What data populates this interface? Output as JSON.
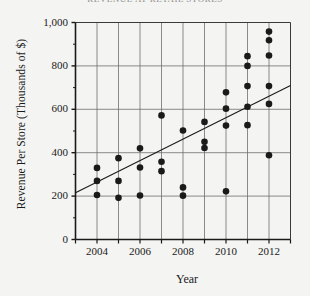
{
  "chart_data": {
    "type": "scatter",
    "title": "REVENUE AT RETAIL STORES",
    "xlabel": "Year",
    "ylabel": "Revenue Per Store (Thousands of $)",
    "xlim": [
      2003,
      2013
    ],
    "ylim": [
      0,
      1000
    ],
    "yticks": [
      "0",
      "200",
      "400",
      "600",
      "800",
      "1,000"
    ],
    "ytick_values": [
      0,
      200,
      400,
      600,
      800,
      1000
    ],
    "xticks": [
      "2004",
      "2006",
      "2008",
      "2010",
      "2012"
    ],
    "xtick_values": [
      2004,
      2006,
      2008,
      2010,
      2012
    ],
    "xminor_values": [
      2005,
      2007,
      2009,
      2011
    ],
    "grid": true,
    "legend": "none",
    "marker": "filled-circle",
    "marker_color": "#1a1a1a",
    "trendline": {
      "present": true,
      "x_start": 2003,
      "y_start": 215,
      "x_end": 2013,
      "y_end": 710,
      "color": "#1a1a1a"
    },
    "points": [
      {
        "x": 2004,
        "y": 330
      },
      {
        "x": 2004,
        "y": 270
      },
      {
        "x": 2004,
        "y": 205
      },
      {
        "x": 2005,
        "y": 375
      },
      {
        "x": 2005,
        "y": 270
      },
      {
        "x": 2005,
        "y": 192
      },
      {
        "x": 2006,
        "y": 420
      },
      {
        "x": 2006,
        "y": 332
      },
      {
        "x": 2006,
        "y": 203
      },
      {
        "x": 2007,
        "y": 572
      },
      {
        "x": 2007,
        "y": 358
      },
      {
        "x": 2007,
        "y": 315
      },
      {
        "x": 2008,
        "y": 502
      },
      {
        "x": 2008,
        "y": 240
      },
      {
        "x": 2008,
        "y": 202
      },
      {
        "x": 2009,
        "y": 542
      },
      {
        "x": 2009,
        "y": 450
      },
      {
        "x": 2009,
        "y": 422
      },
      {
        "x": 2010,
        "y": 678
      },
      {
        "x": 2010,
        "y": 603
      },
      {
        "x": 2010,
        "y": 525
      },
      {
        "x": 2010,
        "y": 222
      },
      {
        "x": 2011,
        "y": 845
      },
      {
        "x": 2011,
        "y": 800
      },
      {
        "x": 2011,
        "y": 707
      },
      {
        "x": 2011,
        "y": 612
      },
      {
        "x": 2011,
        "y": 527
      },
      {
        "x": 2012,
        "y": 958
      },
      {
        "x": 2012,
        "y": 918
      },
      {
        "x": 2012,
        "y": 848
      },
      {
        "x": 2012,
        "y": 707
      },
      {
        "x": 2012,
        "y": 625
      },
      {
        "x": 2012,
        "y": 388
      }
    ]
  }
}
